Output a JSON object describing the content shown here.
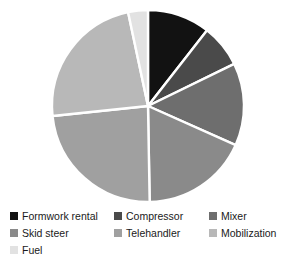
{
  "chart_data": {
    "type": "pie",
    "title": "",
    "start_angle_deg": 0,
    "direction": "clockwise",
    "legend_position": "bottom",
    "grid": false,
    "categories": [
      "Formwork rental",
      "Compressor",
      "Mixer",
      "Skid steer",
      "Telehandler",
      "Mobilization",
      "Fuel"
    ],
    "values": [
      10.5,
      7.2,
      13.9,
      18.1,
      23.6,
      23.3,
      3.4
    ],
    "units": "percent",
    "slices": [
      {
        "label": "Formwork rental",
        "value": 10.5,
        "angle_deg": 38,
        "color": "#121212"
      },
      {
        "label": "Compressor",
        "value": 7.2,
        "angle_deg": 26,
        "color": "#4a4a4a"
      },
      {
        "label": "Mixer",
        "value": 13.9,
        "angle_deg": 50,
        "color": "#6e6e6e"
      },
      {
        "label": "Skid steer",
        "value": 18.1,
        "angle_deg": 65,
        "color": "#8a8a8a"
      },
      {
        "label": "Telehandler",
        "value": 23.6,
        "angle_deg": 85,
        "color": "#a0a0a0"
      },
      {
        "label": "Mobilization",
        "value": 23.3,
        "angle_deg": 84,
        "color": "#b8b8b8"
      },
      {
        "label": "Fuel",
        "value": 3.4,
        "angle_deg": 12,
        "color": "#e2e2e2"
      }
    ],
    "separator_color": "#ffffff",
    "background_color": "#ffffff"
  },
  "legend": {
    "rows": [
      [
        {
          "label": "Formwork rental",
          "color": "#121212"
        },
        {
          "label": "Compressor",
          "color": "#4a4a4a"
        },
        {
          "label": "Mixer",
          "color": "#6e6e6e"
        }
      ],
      [
        {
          "label": "Skid steer",
          "color": "#8a8a8a"
        },
        {
          "label": "Telehandler",
          "color": "#a0a0a0"
        },
        {
          "label": "Mobilization",
          "color": "#b8b8b8"
        }
      ],
      [
        {
          "label": "Fuel",
          "color": "#e2e2e2"
        }
      ]
    ]
  }
}
